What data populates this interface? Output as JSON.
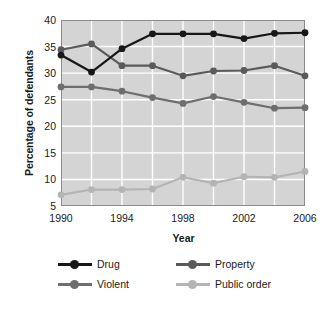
{
  "chart_data": {
    "type": "line",
    "title": "",
    "xlabel": "Year",
    "ylabel": "Percentage of defendants",
    "x": [
      1990,
      1992,
      1994,
      1996,
      1998,
      2000,
      2002,
      2004,
      2006
    ],
    "x_tick_labels": [
      "1990",
      "1994",
      "1998",
      "2002",
      "2006"
    ],
    "x_tick_values": [
      1990,
      1994,
      1998,
      2002,
      2006
    ],
    "xlim": [
      1990,
      2006
    ],
    "y_tick_labels": [
      "40",
      "35",
      "30",
      "25",
      "20",
      "15",
      "10",
      "5"
    ],
    "y_tick_values": [
      40,
      35,
      30,
      25,
      20,
      15,
      10,
      5
    ],
    "ylim": [
      5,
      40
    ],
    "grid": true,
    "grid_color": "#ffffff",
    "plot_background": "#d4d4d4",
    "legend_position": "bottom",
    "series": [
      {
        "name": "Drug",
        "color": "#171717",
        "values": [
          33.4,
          30.2,
          34.6,
          37.4,
          37.4,
          37.4,
          36.5,
          37.5,
          37.6
        ]
      },
      {
        "name": "Property",
        "color": "#5a5a5a",
        "values": [
          34.4,
          35.5,
          31.4,
          31.4,
          29.5,
          30.4,
          30.5,
          31.4,
          29.5
        ]
      },
      {
        "name": "Violent",
        "color": "#6e6e6e",
        "values": [
          27.4,
          27.4,
          26.6,
          25.4,
          24.3,
          25.6,
          24.5,
          23.4,
          23.5
        ]
      },
      {
        "name": "Public order",
        "color": "#b4b4b4",
        "values": [
          7.1,
          8.1,
          8.1,
          8.2,
          10.4,
          9.3,
          10.5,
          10.4,
          11.5
        ]
      }
    ]
  },
  "legend": {
    "items": [
      {
        "label": "Drug"
      },
      {
        "label": "Property"
      },
      {
        "label": "Violent"
      },
      {
        "label": "Public order"
      }
    ]
  }
}
